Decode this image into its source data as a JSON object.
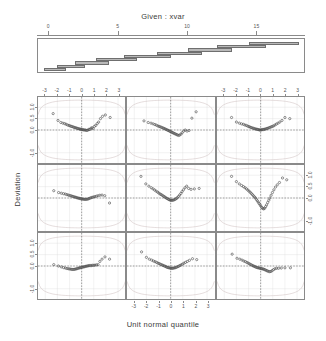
{
  "chart_data": {
    "type": "scatter",
    "plot_kind": "coplot-normal-qq",
    "title": "Given : xvar",
    "xlabel": "Unit normal quantile",
    "ylabel": "Deviation",
    "grid": true,
    "legend": "none",
    "conditioning": {
      "variable": "xvar",
      "axis_label_text": "Given : xvar",
      "axis_ticks": [
        0,
        5,
        10,
        15
      ],
      "axis_tick_labels": [
        "0",
        "5",
        "10",
        "15"
      ],
      "axis_range": [
        -0.8,
        18.5
      ],
      "n_intervals": 9,
      "intervals": [
        {
          "index": 1,
          "from": -0.4,
          "to": 1.2
        },
        {
          "index": 2,
          "from": 0.6,
          "to": 2.6
        },
        {
          "index": 3,
          "from": 1.9,
          "to": 4.3
        },
        {
          "index": 4,
          "from": 3.4,
          "to": 6.3
        },
        {
          "index": 5,
          "from": 5.4,
          "to": 8.8
        },
        {
          "index": 6,
          "from": 7.8,
          "to": 11.0
        },
        {
          "index": 7,
          "from": 10.0,
          "to": 13.2
        },
        {
          "index": 8,
          "from": 12.1,
          "to": 15.6
        },
        {
          "index": 9,
          "from": 14.4,
          "to": 18.0
        }
      ]
    },
    "panel_layout": {
      "rows": 3,
      "cols": 3,
      "order": "bottom-left-to-top-right"
    },
    "xlim": [
      -3.6,
      3.6
    ],
    "ylim": [
      -1.45,
      1.45
    ],
    "xticks": [
      -3,
      -2,
      -1,
      0,
      1,
      2,
      3
    ],
    "xtick_labels": [
      "-3",
      "-2",
      "-1",
      "0",
      "1",
      "2",
      "3"
    ],
    "yticks": [
      -1.0,
      0.0,
      0.5,
      1.0
    ],
    "ytick_labels": [
      "-1.0",
      "0.0",
      "0.5",
      "1.0"
    ],
    "reference_lines": {
      "horizontal_at": 0,
      "vertical_at": 0,
      "style": "dashed"
    },
    "envelope": {
      "description": "simulated confidence envelope curves",
      "color": "#c9b9b9"
    },
    "point_symbol": "open-circle",
    "point_color": "#4a4a4a",
    "panels": [
      {
        "row": 0,
        "col": 0,
        "panel_number": 7,
        "points_x": [
          -2.35,
          -1.95,
          -1.72,
          -1.55,
          -1.4,
          -1.28,
          -1.16,
          -1.05,
          -0.95,
          -0.86,
          -0.77,
          -0.68,
          -0.6,
          -0.52,
          -0.44,
          -0.36,
          -0.29,
          -0.21,
          -0.14,
          -0.07,
          0,
          0.07,
          0.14,
          0.21,
          0.29,
          0.36,
          0.44,
          0.52,
          0.6,
          0.68,
          0.77,
          0.86,
          0.95,
          1.05,
          1.16,
          1.28,
          1.4,
          1.55,
          1.72,
          1.95,
          2.35
        ],
        "points_y": [
          0.72,
          0.42,
          0.33,
          0.3,
          0.28,
          0.25,
          0.22,
          0.2,
          0.18,
          0.16,
          0.15,
          0.13,
          0.11,
          0.1,
          0.09,
          0.07,
          0.06,
          0.05,
          0.04,
          0.03,
          0.02,
          0.02,
          0.01,
          0.0,
          0.0,
          -0.01,
          -0.02,
          0.0,
          0.03,
          0.02,
          0.08,
          0.1,
          0.06,
          0.16,
          0.2,
          0.28,
          0.35,
          0.5,
          0.6,
          0.66,
          0.55
        ]
      },
      {
        "row": 0,
        "col": 1,
        "panel_number": 8,
        "points_x": [
          -2.2,
          -1.85,
          -1.62,
          -1.45,
          -1.3,
          -1.18,
          -1.06,
          -0.96,
          -0.86,
          -0.77,
          -0.68,
          -0.59,
          -0.51,
          -0.43,
          -0.35,
          -0.27,
          -0.2,
          -0.12,
          -0.05,
          0.03,
          0.1,
          0.18,
          0.25,
          0.33,
          0.41,
          0.49,
          0.57,
          0.66,
          0.75,
          0.85,
          0.95,
          1.07,
          1.2,
          1.35,
          1.52,
          1.75,
          2.1
        ],
        "points_y": [
          0.4,
          0.33,
          0.3,
          0.27,
          0.24,
          0.21,
          0.18,
          0.16,
          0.14,
          0.12,
          0.1,
          0.08,
          0.06,
          0.04,
          0.02,
          0.0,
          -0.02,
          -0.04,
          -0.06,
          -0.08,
          -0.1,
          -0.12,
          -0.14,
          -0.16,
          -0.18,
          -0.2,
          -0.22,
          -0.24,
          -0.22,
          -0.18,
          -0.12,
          -0.05,
          0.0,
          -0.05,
          -0.02,
          0.52,
          0.8
        ]
      },
      {
        "row": 0,
        "col": 2,
        "panel_number": 9,
        "points_x": [
          -2.4,
          -2.0,
          -1.76,
          -1.58,
          -1.43,
          -1.3,
          -1.18,
          -1.07,
          -0.97,
          -0.88,
          -0.79,
          -0.7,
          -0.61,
          -0.53,
          -0.45,
          -0.37,
          -0.29,
          -0.22,
          -0.14,
          -0.07,
          0,
          0.07,
          0.14,
          0.22,
          0.29,
          0.37,
          0.45,
          0.53,
          0.61,
          0.7,
          0.79,
          0.88,
          0.97,
          1.07,
          1.18,
          1.3,
          1.43,
          1.58,
          1.76,
          2.0,
          2.4
        ],
        "points_y": [
          0.55,
          0.35,
          0.3,
          0.27,
          0.25,
          0.22,
          0.2,
          0.17,
          0.15,
          0.13,
          0.11,
          0.09,
          0.08,
          0.06,
          0.05,
          0.04,
          0.03,
          0.02,
          0.01,
          0.0,
          0.0,
          0.01,
          0.02,
          0.02,
          0.03,
          0.04,
          0.05,
          0.07,
          0.08,
          0.1,
          0.12,
          0.14,
          0.16,
          0.18,
          0.22,
          0.26,
          0.3,
          0.35,
          0.42,
          0.55,
          0.5
        ]
      },
      {
        "row": 1,
        "col": 0,
        "panel_number": 4,
        "points_x": [
          -2.3,
          -1.9,
          -1.68,
          -1.5,
          -1.35,
          -1.22,
          -1.1,
          -1.0,
          -0.9,
          -0.81,
          -0.72,
          -0.63,
          -0.55,
          -0.47,
          -0.39,
          -0.31,
          -0.23,
          -0.16,
          -0.08,
          0,
          0.08,
          0.16,
          0.23,
          0.31,
          0.39,
          0.47,
          0.55,
          0.63,
          0.72,
          0.81,
          0.9,
          1.0,
          1.1,
          1.22,
          1.35,
          1.5,
          1.68,
          1.9,
          2.3
        ],
        "points_y": [
          0.32,
          0.24,
          0.21,
          0.19,
          0.17,
          0.15,
          0.13,
          0.11,
          0.1,
          0.08,
          0.07,
          0.05,
          0.04,
          0.03,
          0.01,
          0.0,
          -0.01,
          -0.02,
          -0.03,
          -0.04,
          -0.05,
          -0.05,
          -0.06,
          -0.06,
          -0.06,
          -0.05,
          -0.04,
          -0.02,
          0.0,
          0.02,
          0.03,
          0.05,
          0.06,
          0.08,
          0.1,
          0.12,
          0.13,
          0.1,
          -0.22
        ]
      },
      {
        "row": 1,
        "col": 1,
        "panel_number": 5,
        "points_x": [
          -2.45,
          -2.05,
          -1.8,
          -1.6,
          -1.45,
          -1.32,
          -1.2,
          -1.08,
          -0.98,
          -0.88,
          -0.79,
          -0.7,
          -0.61,
          -0.53,
          -0.45,
          -0.37,
          -0.29,
          -0.21,
          -0.14,
          -0.06,
          0.01,
          0.09,
          0.16,
          0.24,
          0.32,
          0.4,
          0.48,
          0.56,
          0.65,
          0.74,
          0.84,
          0.94,
          1.05,
          1.18,
          1.32,
          1.48,
          1.68,
          1.95,
          2.35
        ],
        "points_y": [
          0.95,
          0.62,
          0.52,
          0.45,
          0.4,
          0.35,
          0.3,
          0.26,
          0.22,
          0.18,
          0.15,
          0.12,
          0.09,
          0.06,
          0.03,
          0.0,
          -0.02,
          -0.05,
          -0.07,
          -0.09,
          -0.1,
          -0.1,
          -0.1,
          -0.09,
          -0.07,
          -0.05,
          -0.02,
          0.02,
          0.07,
          0.13,
          0.2,
          0.28,
          0.36,
          0.45,
          0.52,
          0.42,
          0.38,
          0.4,
          0.42
        ]
      },
      {
        "row": 1,
        "col": 2,
        "panel_number": 6,
        "points_x": [
          -2.4,
          -2.0,
          -1.76,
          -1.57,
          -1.42,
          -1.29,
          -1.17,
          -1.06,
          -0.96,
          -0.86,
          -0.77,
          -0.68,
          -0.6,
          -0.51,
          -0.43,
          -0.35,
          -0.28,
          -0.2,
          -0.13,
          -0.05,
          0.02,
          0.1,
          0.17,
          0.25,
          0.33,
          0.41,
          0.49,
          0.58,
          0.67,
          0.76,
          0.86,
          0.97,
          1.09,
          1.22,
          1.37,
          1.55,
          1.8,
          2.15
        ],
        "points_y": [
          0.95,
          0.72,
          0.62,
          0.55,
          0.5,
          0.45,
          0.4,
          0.35,
          0.3,
          0.25,
          0.2,
          0.15,
          0.1,
          0.05,
          0.0,
          -0.06,
          -0.12,
          -0.18,
          -0.24,
          -0.3,
          -0.36,
          -0.42,
          -0.46,
          -0.48,
          -0.45,
          -0.38,
          -0.3,
          -0.2,
          -0.1,
          0.0,
          0.12,
          0.24,
          0.36,
          0.48,
          0.58,
          0.68,
          0.88,
          0.8
        ]
      },
      {
        "row": 2,
        "col": 0,
        "panel_number": 1,
        "points_x": [
          -2.3,
          -1.92,
          -1.68,
          -1.5,
          -1.35,
          -1.22,
          -1.1,
          -1.0,
          -0.9,
          -0.81,
          -0.72,
          -0.63,
          -0.55,
          -0.47,
          -0.39,
          -0.31,
          -0.23,
          -0.16,
          -0.08,
          0,
          0.08,
          0.16,
          0.23,
          0.31,
          0.39,
          0.47,
          0.55,
          0.63,
          0.72,
          0.81,
          0.9,
          1.0,
          1.1,
          1.22,
          1.35,
          1.5,
          1.68,
          1.92,
          2.3
        ],
        "points_y": [
          0.06,
          0.0,
          -0.04,
          -0.07,
          -0.09,
          -0.11,
          -0.12,
          -0.13,
          -0.14,
          -0.15,
          -0.15,
          -0.15,
          -0.14,
          -0.13,
          -0.12,
          -0.1,
          -0.09,
          -0.08,
          -0.07,
          -0.06,
          -0.05,
          -0.04,
          -0.03,
          -0.02,
          -0.01,
          0.0,
          0.01,
          0.02,
          0.02,
          0.02,
          0.03,
          0.03,
          0.04,
          0.05,
          0.06,
          0.2,
          0.3,
          0.4,
          0.3
        ]
      },
      {
        "row": 2,
        "col": 1,
        "panel_number": 2,
        "points_x": [
          -2.4,
          -2.0,
          -1.76,
          -1.57,
          -1.42,
          -1.29,
          -1.17,
          -1.06,
          -0.96,
          -0.86,
          -0.77,
          -0.68,
          -0.6,
          -0.51,
          -0.43,
          -0.35,
          -0.28,
          -0.2,
          -0.13,
          -0.05,
          0.02,
          0.1,
          0.17,
          0.25,
          0.33,
          0.41,
          0.49,
          0.58,
          0.67,
          0.76,
          0.86,
          0.97,
          1.09,
          1.22,
          1.37,
          1.55,
          1.8,
          2.15
        ],
        "points_y": [
          0.62,
          0.38,
          0.3,
          0.26,
          0.22,
          0.19,
          0.16,
          0.13,
          0.11,
          0.08,
          0.06,
          0.04,
          0.02,
          0.0,
          -0.02,
          -0.04,
          -0.06,
          -0.07,
          -0.08,
          -0.09,
          -0.1,
          -0.1,
          -0.1,
          -0.09,
          -0.08,
          -0.07,
          -0.05,
          -0.03,
          -0.01,
          0.02,
          0.05,
          0.08,
          0.12,
          0.16,
          0.2,
          0.25,
          0.32,
          0.28
        ]
      },
      {
        "row": 2,
        "col": 2,
        "panel_number": 3,
        "points_x": [
          -2.35,
          -1.95,
          -1.72,
          -1.54,
          -1.39,
          -1.26,
          -1.14,
          -1.04,
          -0.94,
          -0.85,
          -0.76,
          -0.67,
          -0.59,
          -0.51,
          -0.43,
          -0.35,
          -0.27,
          -0.2,
          -0.12,
          -0.05,
          0.03,
          0.1,
          0.18,
          0.25,
          0.33,
          0.41,
          0.49,
          0.57,
          0.66,
          0.75,
          0.85,
          0.95,
          1.06,
          1.18,
          1.32,
          1.48,
          1.7,
          2.0,
          2.45
        ],
        "points_y": [
          0.52,
          0.34,
          0.3,
          0.26,
          0.22,
          0.19,
          0.16,
          0.13,
          0.1,
          0.07,
          0.05,
          0.02,
          0.0,
          -0.02,
          -0.04,
          -0.06,
          -0.07,
          -0.08,
          -0.09,
          -0.1,
          -0.11,
          -0.12,
          -0.13,
          -0.14,
          -0.16,
          -0.18,
          -0.2,
          -0.22,
          -0.24,
          -0.25,
          -0.24,
          -0.2,
          -0.16,
          -0.12,
          -0.1,
          -0.1,
          -0.09,
          -0.08,
          -0.08
        ]
      }
    ]
  }
}
